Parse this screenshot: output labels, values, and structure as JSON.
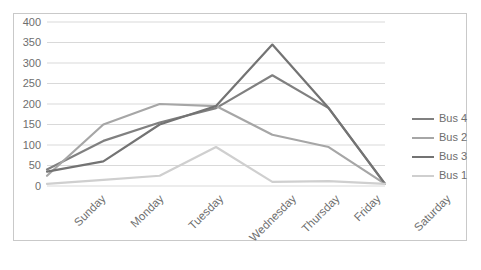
{
  "chart_data": {
    "type": "line",
    "title": "",
    "xlabel": "",
    "ylabel": "",
    "categories": [
      "Sunday",
      "Monday",
      "Tuesday",
      "Wednesday",
      "Thursday",
      "Friday",
      "Saturday"
    ],
    "ylim": [
      0,
      400
    ],
    "ytick_labels": [
      "400",
      "350",
      "300",
      "250",
      "200",
      "150",
      "100",
      "50",
      "0"
    ],
    "ytick_values": [
      400,
      350,
      300,
      250,
      200,
      150,
      100,
      50,
      0
    ],
    "grid": true,
    "legend_position": "right",
    "series": [
      {
        "name": "Bus 4",
        "color": "#808080",
        "values": [
          40,
          110,
          155,
          190,
          270,
          190,
          5
        ]
      },
      {
        "name": "Bus 2",
        "color": "#a6a6a6",
        "values": [
          25,
          150,
          200,
          195,
          125,
          95,
          5
        ]
      },
      {
        "name": "Bus 3",
        "color": "#737373",
        "values": [
          35,
          60,
          150,
          195,
          345,
          190,
          5
        ]
      },
      {
        "name": "Bus 1",
        "color": "#cfcfcf",
        "values": [
          5,
          15,
          25,
          95,
          10,
          12,
          5
        ]
      }
    ]
  },
  "legend": {
    "items": [
      {
        "label": "Bus 4"
      },
      {
        "label": "Bus 2"
      },
      {
        "label": "Bus 3"
      },
      {
        "label": "Bus 1"
      }
    ]
  },
  "colors": {
    "border": "#c9c9c9",
    "gridline": "#d9d9d9",
    "text": "#6e6e6e",
    "background": "#ffffff"
  }
}
